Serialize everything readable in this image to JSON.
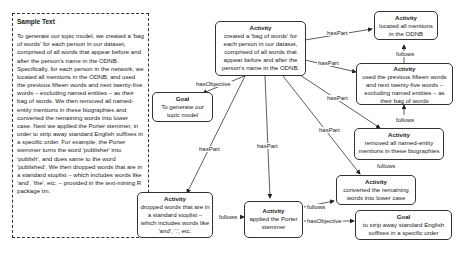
{
  "sample_text": {
    "title": "Sample Text",
    "body": "To generate our topic model, we created a 'bag of words' for each person in our dataset, comprised of all words that appear before and after the person's name in the ODNB. Specifically, for each person in the network, we located all mentions in the ODNB, and used the previous fifteen words and next twenty-five words – excluding named entities – as their bag of words. We then removed all named-entity mentions in these biographies and converted the remaining words into lower case. Next we applied the Porter stemmer, in order to strip away standard English suffixes in a specific order. For example, the Porter stemmer turns the word 'publisher' into 'publish', and does same to the word 'published'. We then dropped words that are in a standard stoplist – which includes words like 'and', 'the', etc. – provided in the text-mining R package tm."
  },
  "nodes": {
    "main": {
      "type": "Activity",
      "text": "created a 'bag of words' for each person in our dataset, comprised of all words that appear before and after the person's name in the ODNB."
    },
    "goal_topic": {
      "type": "Goal",
      "text": "To generate our topic model"
    },
    "located": {
      "type": "Activity",
      "text": "located all mentions in the ODNB"
    },
    "used_prev": {
      "type": "Activity",
      "text": "used the previous fifteen words and next twenty-five words – excluding named entities – as their bag of words"
    },
    "removed": {
      "type": "Activity",
      "text": "removed all named-entity mentions in these biographies"
    },
    "converted": {
      "type": "Activity",
      "text": "converted the remaining words into lower case"
    },
    "goal_strip": {
      "type": "Goal",
      "text": "to strip away standard English suffixes in a specific order"
    },
    "porter": {
      "type": "Activity",
      "text": "applied the Porter stemmer"
    },
    "dropped": {
      "type": "Activity",
      "text": "dropped words that are in a standard stoplist – which includes words like 'and', '.', etc."
    }
  },
  "edge_labels": {
    "has_objective_1": "hasObjective",
    "has_part_located": "hasPart",
    "has_part_used": "hasPart",
    "has_part_removed": "hasPart",
    "has_part_converted": "hasPart",
    "has_part_porter": "hasPart",
    "has_part_dropped": "hasPart",
    "follows_1": "follows",
    "follows_2": "follows",
    "follows_3": "follows",
    "follows_4": "follows",
    "follows_5": "follows",
    "has_objective_2": "hasObjective"
  }
}
